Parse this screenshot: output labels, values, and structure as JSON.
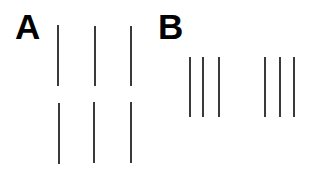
{
  "panels": [
    {
      "label": "A",
      "description": "Two rows of three evenly spaced vertical lines",
      "lines": [
        {
          "x": 57,
          "y1": 25,
          "y2": 86
        },
        {
          "x": 94,
          "y1": 26,
          "y2": 86
        },
        {
          "x": 130,
          "y1": 26,
          "y2": 86
        },
        {
          "x": 58,
          "y1": 103,
          "y2": 164
        },
        {
          "x": 93,
          "y1": 102,
          "y2": 163
        },
        {
          "x": 130,
          "y1": 102,
          "y2": 163
        }
      ]
    },
    {
      "label": "B",
      "description": "Two groups of three closely spaced vertical lines in one row",
      "lines": [
        {
          "x": 189,
          "y1": 57,
          "y2": 117
        },
        {
          "x": 202,
          "y1": 57,
          "y2": 117
        },
        {
          "x": 218,
          "y1": 57,
          "y2": 117
        },
        {
          "x": 264,
          "y1": 57,
          "y2": 117
        },
        {
          "x": 279,
          "y1": 57,
          "y2": 117
        },
        {
          "x": 293,
          "y1": 57,
          "y2": 117
        }
      ]
    }
  ],
  "colors": {
    "line": "#3a3a3a",
    "label": "#000000",
    "background": "#ffffff"
  }
}
